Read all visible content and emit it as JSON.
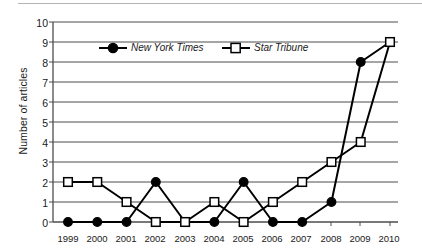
{
  "chart_data": {
    "type": "line",
    "title": "",
    "xlabel": "",
    "ylabel": "Number of articles",
    "categories": [
      "1999",
      "2000",
      "2001",
      "2002",
      "2003",
      "2004",
      "2005",
      "2006",
      "2007",
      "2008",
      "2009",
      "2010"
    ],
    "x": [
      1999,
      2000,
      2001,
      2002,
      2003,
      2004,
      2005,
      2006,
      2007,
      2008,
      2009,
      2010
    ],
    "series": [
      {
        "name": "New York Times",
        "marker": "filled-circle",
        "color": "#000000",
        "values": [
          0,
          0,
          0,
          2,
          0,
          0,
          2,
          0,
          0,
          1,
          8,
          9
        ]
      },
      {
        "name": "Star Tribune",
        "marker": "open-square",
        "color": "#000000",
        "values": [
          2,
          2,
          1,
          0,
          0,
          1,
          0,
          1,
          2,
          3,
          4,
          9
        ]
      }
    ],
    "ylim": [
      0,
      10
    ],
    "yticks": [
      0,
      1,
      2,
      3,
      4,
      5,
      6,
      7,
      8,
      9,
      10
    ],
    "grid": "horizontal",
    "legend_position": "inside-top-center"
  },
  "axis": {
    "y_title": "Number of articles",
    "y_tick_labels": [
      "10",
      "9",
      "8",
      "7",
      "6",
      "5",
      "4",
      "3",
      "2",
      "1",
      "0"
    ],
    "x_tick_labels": [
      "1999",
      "2000",
      "2001",
      "2002",
      "2003",
      "2004",
      "2005",
      "2006",
      "2007",
      "2008",
      "2009",
      "2010"
    ]
  },
  "legend": {
    "entries": [
      {
        "label": "New York Times",
        "marker": "filled-circle"
      },
      {
        "label": "Star Tribune",
        "marker": "open-square"
      }
    ]
  }
}
